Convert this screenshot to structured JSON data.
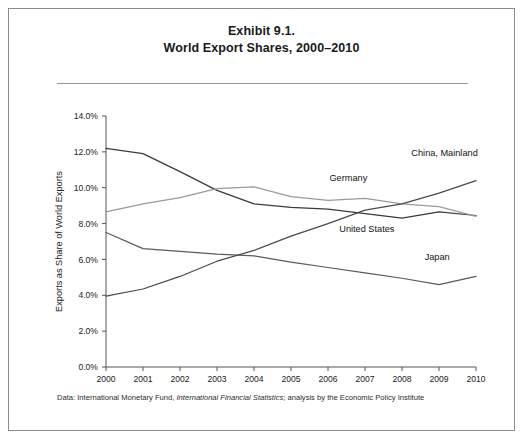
{
  "figure": {
    "title_line1": "Exhibit 9.1.",
    "title_line2": "World Export Shares, 2000–2010",
    "source_prefix": "Data: International Monetary Fund, ",
    "source_italic": "International Financial Statistics",
    "source_suffix": "; analysis by the Economic Policy Institute"
  },
  "chart_data": {
    "type": "line",
    "title": "Exhibit 9.1. World Export Shares, 2000–2010",
    "xlabel": "",
    "ylabel": "Exports as Share of World Exports",
    "x": [
      2000,
      2001,
      2002,
      2003,
      2004,
      2005,
      2006,
      2007,
      2008,
      2009,
      2010
    ],
    "xtick_labels": [
      "2000",
      "2001",
      "2002",
      "2003",
      "2004",
      "2005",
      "2006",
      "2007",
      "2008",
      "2009",
      "2010"
    ],
    "ytick_labels": [
      "0.0%",
      "2.0%",
      "4.0%",
      "6.0%",
      "8.0%",
      "10.0%",
      "12.0%",
      "14.0%"
    ],
    "ytick_values": [
      0,
      2,
      4,
      6,
      8,
      10,
      12,
      14
    ],
    "ylim": [
      0,
      14
    ],
    "xlim": [
      2000,
      2010
    ],
    "grid": false,
    "legend": "inline-labels",
    "series": [
      {
        "name": "United States",
        "color": "#3a3a3a",
        "label_x": 2007.05,
        "label_y": 7.55,
        "label_anchor": "middle",
        "values": [
          12.2,
          11.9,
          10.9,
          9.85,
          9.1,
          8.9,
          8.8,
          8.55,
          8.3,
          8.65,
          8.45
        ]
      },
      {
        "name": "Germany",
        "color": "#9a9a9a",
        "label_x": 2006.55,
        "label_y": 10.35,
        "label_anchor": "middle",
        "values": [
          8.65,
          9.1,
          9.45,
          9.95,
          10.05,
          9.5,
          9.3,
          9.4,
          9.1,
          8.95,
          8.4
        ]
      },
      {
        "name": "Japan",
        "color": "#5a5a5a",
        "label_x": 2008.95,
        "label_y": 5.95,
        "label_anchor": "middle",
        "values": [
          7.5,
          6.6,
          6.45,
          6.3,
          6.2,
          5.85,
          5.55,
          5.25,
          4.95,
          4.6,
          5.05
        ]
      },
      {
        "name": "China, Mainland",
        "color": "#4a4a4a",
        "label_x": 2009.15,
        "label_y": 11.75,
        "label_anchor": "middle",
        "values": [
          3.95,
          4.35,
          5.05,
          5.9,
          6.5,
          7.3,
          8.0,
          8.75,
          9.1,
          9.7,
          10.4
        ]
      }
    ]
  }
}
